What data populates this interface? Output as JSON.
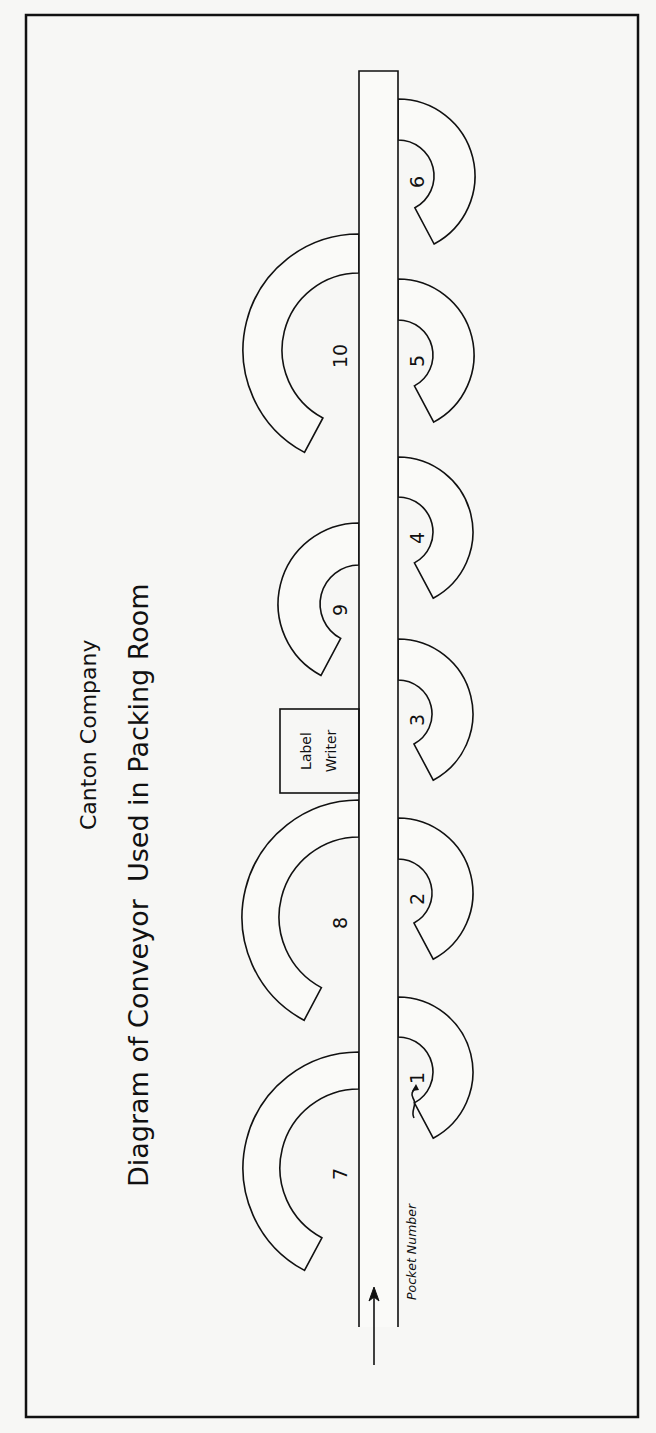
{
  "title": {
    "company": "Canton Company",
    "main": "Diagram of Conveyor  Used in Packing Room"
  },
  "conveyor": {
    "left_x": 359,
    "right_x": 398,
    "top_y": 71,
    "bottom_y": 1327,
    "direction_arrow": "arrow-up-icon"
  },
  "label_writer": {
    "line1": "Label",
    "line2": "Writer"
  },
  "pocket_number_label": "Pocket Number",
  "pockets": [
    {
      "number": "1",
      "side": "right",
      "cy": 1072,
      "R": 75,
      "r": 35
    },
    {
      "number": "2",
      "side": "right",
      "cy": 893,
      "R": 75,
      "r": 34
    },
    {
      "number": "3",
      "side": "right",
      "cy": 714,
      "R": 75,
      "r": 34
    },
    {
      "number": "4",
      "side": "right",
      "cy": 532,
      "R": 75,
      "r": 35
    },
    {
      "number": "5",
      "side": "right",
      "cy": 355,
      "R": 76,
      "r": 35
    },
    {
      "number": "6",
      "side": "right",
      "cy": 176,
      "R": 77,
      "r": 36
    },
    {
      "number": "7",
      "side": "left",
      "cy": 1168,
      "R": 116,
      "r": 79
    },
    {
      "number": "8",
      "side": "left",
      "cy": 917,
      "R": 117,
      "r": 80
    },
    {
      "number": "9",
      "side": "left",
      "cy": 604,
      "R": 81,
      "r": 39
    },
    {
      "number": "10",
      "side": "left",
      "cy": 350,
      "R": 116,
      "r": 77
    }
  ],
  "colors": {
    "ink": "#111111",
    "paper": "#f7f7f5"
  }
}
